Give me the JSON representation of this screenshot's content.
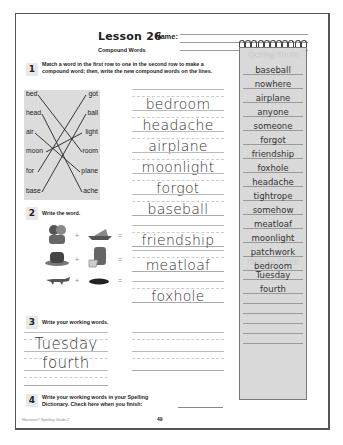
{
  "header": {
    "title": "Lesson 26",
    "name_label": "Name:",
    "subtitle": "Compound Words"
  },
  "section1": {
    "number": "1",
    "instruction": "Match a word in the first row to one in the second row to make a compound word; then, write the new compound words on the lines.",
    "left_words": [
      "bed",
      "head",
      "air",
      "moon",
      "for",
      "base"
    ],
    "right_words": [
      "got",
      "ball",
      "light",
      "room",
      "plane",
      "ache"
    ],
    "answers": [
      "bedroom",
      "headache",
      "airplane",
      "moonlight",
      "forgot",
      "baseball"
    ]
  },
  "section2": {
    "number": "2",
    "instruction": "Write the word.",
    "rows": [
      {
        "icon1": "friends-picture",
        "icon2": "ship-picture",
        "answer": "friendship"
      },
      {
        "icon1": "meat-picture",
        "icon2": "loaf-picture",
        "answer": "meatloaf"
      },
      {
        "icon1": "fox-picture",
        "icon2": "hole-picture",
        "answer": "foxhole"
      }
    ],
    "plus": "+",
    "equals": "="
  },
  "section3": {
    "number": "3",
    "instruction": "Write your working words.",
    "words": [
      "Tuesday",
      "fourth"
    ]
  },
  "section4": {
    "number": "4",
    "instruction": "Write your working words in your Spelling Dictionary. Check here when you finish:"
  },
  "notebook": {
    "spelling_heading": "Spelling Words",
    "spelling_words": [
      "baseball",
      "nowhere",
      "airplane",
      "anyone",
      "someone",
      "forgot",
      "friendship",
      "foxhole",
      "headache",
      "tightrope",
      "somehow",
      "meatloaf",
      "moonlight",
      "patchwork",
      "bedroom"
    ],
    "working_heading": "Working Words",
    "working_words": [
      "Tuesday",
      "fourth",
      "",
      "",
      "",
      "",
      ""
    ]
  },
  "footer": {
    "credit": "Horizons® Spelling Grade 2",
    "page_number": "49"
  }
}
